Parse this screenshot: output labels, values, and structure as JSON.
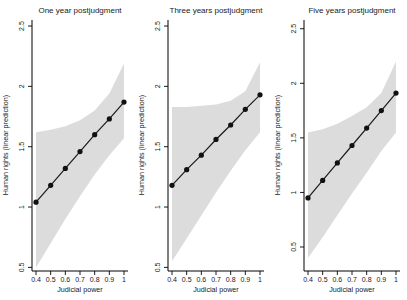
{
  "figure": {
    "background": "#ffffff",
    "band_color": "#dcdcdc",
    "line_color": "#1a1a1a",
    "marker_color": "#111111",
    "axis_color": "#000000"
  },
  "chart_data": [
    {
      "type": "line",
      "title": "One year postjudgment",
      "xlabel": "Judicial power",
      "ylabel": "Human rights (linear prediction)",
      "x": [
        0.4,
        0.5,
        0.6,
        0.7,
        0.8,
        0.9,
        1
      ],
      "series": [
        {
          "name": "linear-prediction",
          "values": [
            1.04,
            1.18,
            1.32,
            1.46,
            1.6,
            1.73,
            1.87
          ]
        },
        {
          "name": "ci-upper",
          "values": [
            1.62,
            1.64,
            1.67,
            1.72,
            1.8,
            1.94,
            2.19
          ]
        },
        {
          "name": "ci-lower",
          "values": [
            0.5,
            0.7,
            0.9,
            1.09,
            1.27,
            1.43,
            1.57
          ]
        }
      ],
      "xticks": [
        0.4,
        0.5,
        0.6,
        0.7,
        0.8,
        0.9,
        1
      ],
      "xtick_labels": [
        "0.4",
        "0.5",
        "0.6",
        "0.7",
        "0.8",
        "0.9",
        "1"
      ],
      "yticks": [
        0.5,
        1,
        1.5,
        2,
        2.5
      ],
      "ytick_labels": [
        "0.5",
        "1",
        "1.5",
        "2",
        "2.5"
      ],
      "xlim": [
        0.4,
        1
      ],
      "ylim": [
        0.47,
        2.55
      ],
      "band": true,
      "marker": "circle",
      "legend": "none",
      "grid": false
    },
    {
      "type": "line",
      "title": "Three years postjudgment",
      "xlabel": "Judicial power",
      "ylabel": "Human rights (linear prediction)",
      "x": [
        0.4,
        0.5,
        0.6,
        0.7,
        0.8,
        0.9,
        1
      ],
      "series": [
        {
          "name": "linear-prediction",
          "values": [
            1.18,
            1.31,
            1.43,
            1.56,
            1.68,
            1.81,
            1.93
          ]
        },
        {
          "name": "ci-upper",
          "values": [
            1.83,
            1.83,
            1.84,
            1.85,
            1.88,
            1.96,
            2.2
          ]
        },
        {
          "name": "ci-lower",
          "values": [
            0.55,
            0.74,
            0.93,
            1.12,
            1.3,
            1.47,
            1.62
          ]
        }
      ],
      "xticks": [
        0.4,
        0.5,
        0.6,
        0.7,
        0.8,
        0.9,
        1
      ],
      "xtick_labels": [
        "0.4",
        "0.5",
        "0.6",
        "0.7",
        "0.8",
        "0.9",
        "1"
      ],
      "yticks": [
        0.5,
        1,
        1.5,
        2,
        2.5
      ],
      "ytick_labels": [
        "0.5",
        "1",
        "1.5",
        "2",
        "2.5"
      ],
      "xlim": [
        0.4,
        1
      ],
      "ylim": [
        0.47,
        2.55
      ],
      "band": true,
      "marker": "circle",
      "legend": "none",
      "grid": false
    },
    {
      "type": "line",
      "title": "Five years postjudgment",
      "xlabel": "Judicial power",
      "ylabel": "Human rights (linear prediction)",
      "x": [
        0.4,
        0.5,
        0.6,
        0.7,
        0.8,
        0.9,
        1
      ],
      "series": [
        {
          "name": "linear-prediction",
          "values": [
            0.95,
            1.11,
            1.27,
            1.43,
            1.59,
            1.75,
            1.91
          ]
        },
        {
          "name": "ci-upper",
          "values": [
            1.55,
            1.58,
            1.63,
            1.7,
            1.78,
            1.91,
            2.2
          ]
        },
        {
          "name": "ci-lower",
          "values": [
            0.4,
            0.59,
            0.79,
            0.99,
            1.18,
            1.38,
            1.55
          ]
        }
      ],
      "xticks": [
        0.4,
        0.5,
        0.6,
        0.7,
        0.8,
        0.9,
        1
      ],
      "xtick_labels": [
        "0.4",
        "0.5",
        "0.6",
        "0.7",
        "0.8",
        "0.9",
        "1"
      ],
      "yticks": [
        0.5,
        1,
        1.5,
        2,
        2.5
      ],
      "ytick_labels": [
        "0.5",
        "1",
        "1.5",
        "2",
        "2.5"
      ],
      "xlim": [
        0.4,
        1
      ],
      "ylim": [
        0.28,
        2.58
      ],
      "band": true,
      "marker": "circle",
      "legend": "none",
      "grid": false
    }
  ]
}
